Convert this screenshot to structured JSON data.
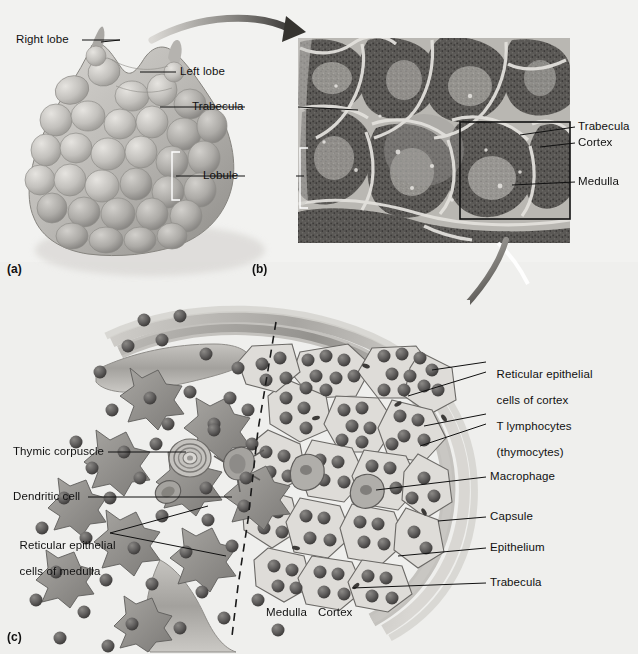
{
  "figure": {
    "background_color": "#f2f2f0",
    "panels": [
      {
        "id": "a",
        "label": "(a)",
        "caption": "Gross anatomy of the thymus"
      },
      {
        "id": "b",
        "label": "(b)",
        "caption": "Light micrograph of thymic lobules"
      },
      {
        "id": "c",
        "label": "(c)",
        "caption": "Histology of cortex and medulla"
      }
    ]
  },
  "panel_a": {
    "id_label": "(a)",
    "labels": [
      {
        "name": "right-lobe",
        "text": "Right lobe"
      },
      {
        "name": "left-lobe",
        "text": "Left lobe"
      }
    ]
  },
  "shared_labels": [
    {
      "name": "trabecula",
      "text": "Trabecula"
    },
    {
      "name": "lobule",
      "text": "Lobule"
    }
  ],
  "panel_b": {
    "id_label": "(b)",
    "labels": [
      {
        "name": "trabecula",
        "text": "Trabecula"
      },
      {
        "name": "cortex",
        "text": "Cortex"
      },
      {
        "name": "medulla",
        "text": "Medulla"
      }
    ]
  },
  "panel_c": {
    "id_label": "(c)",
    "left_labels": [
      {
        "name": "thymic-corpuscle",
        "text": "Thymic corpuscle"
      },
      {
        "name": "dendritic-cell",
        "text": "Dendritic cell"
      },
      {
        "name": "reticular-epithelial-cells-of-medulla",
        "line1": "Reticular epithelial",
        "line2": "cells of medulla"
      }
    ],
    "right_labels": [
      {
        "name": "reticular-epithelial-cells-of-cortex",
        "line1": "Reticular epithelial",
        "line2": "cells of cortex"
      },
      {
        "name": "t-lymphocytes",
        "line1": "T lymphocytes",
        "line2": "(thymocytes)"
      },
      {
        "name": "macrophage",
        "text": "Macrophage"
      },
      {
        "name": "capsule",
        "text": "Capsule"
      },
      {
        "name": "epithelium",
        "text": "Epithelium"
      },
      {
        "name": "trabecula",
        "text": "Trabecula"
      }
    ],
    "zone_labels": [
      {
        "name": "medulla-zone",
        "text": "Medulla"
      },
      {
        "name": "cortex-zone",
        "text": "Cortex"
      }
    ]
  },
  "colors": {
    "background": "#f2f2f0",
    "leader_line": "#111111",
    "text": "#111111",
    "organ_fill": "#b9b7b3",
    "organ_shadow": "#8e8c88",
    "capsule": "#9a9893",
    "cell_dark": "#6f6d6b",
    "lymphocyte": "#5f5d5c",
    "histology_dark": "#4a4846"
  }
}
